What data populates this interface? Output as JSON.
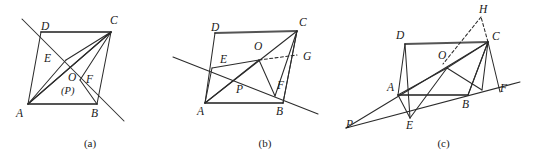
{
  "plate": {
    "width": 537,
    "height": 167,
    "background": "#ffffff",
    "stroke_color": "#2b2b2b",
    "thick_stroke_color": "#555555",
    "label_color": "#1a1a1a"
  },
  "figures": [
    {
      "id": "figure-a",
      "caption": "(a)",
      "description": "Parallelogram ABCD with diagonals and a transversal line through D and B extended; interior points O (also marked P), E on AD side, F near BC side.",
      "labels": [
        {
          "name": "vertex-label-D",
          "text": "D",
          "x": 41,
          "y": 21
        },
        {
          "name": "vertex-label-C",
          "text": "C",
          "x": 110,
          "y": 15
        },
        {
          "name": "vertex-label-E",
          "text": "E",
          "x": 44,
          "y": 53
        },
        {
          "name": "vertex-label-O",
          "text": "O",
          "x": 68,
          "y": 77
        },
        {
          "name": "vertex-label-P",
          "text": "(P)",
          "x": 62,
          "y": 89
        },
        {
          "name": "vertex-label-F",
          "text": "F",
          "x": 86,
          "y": 79
        },
        {
          "name": "vertex-label-A",
          "text": "A",
          "x": 17,
          "y": 108
        },
        {
          "name": "vertex-label-B",
          "text": "B",
          "x": 92,
          "y": 108
        }
      ]
    },
    {
      "id": "figure-b",
      "caption": "(b)",
      "description": "Parallelogram ABCD with a transversal cutting side AD at E and line AB extended beyond B; interior point O joined to A, C and F; G marked on side BC; P marked inside near AB.",
      "labels": [
        {
          "name": "vertex-label-D",
          "text": "D",
          "x": 41,
          "y": 22
        },
        {
          "name": "vertex-label-C",
          "text": "C",
          "x": 129,
          "y": 18
        },
        {
          "name": "vertex-label-O",
          "text": "O",
          "x": 84,
          "y": 42
        },
        {
          "name": "vertex-label-E",
          "text": "E",
          "x": 50,
          "y": 56
        },
        {
          "name": "vertex-label-G",
          "text": "G",
          "x": 134,
          "y": 55
        },
        {
          "name": "vertex-label-P",
          "text": "P",
          "x": 66,
          "y": 86
        },
        {
          "name": "vertex-label-F",
          "text": "F",
          "x": 108,
          "y": 82
        },
        {
          "name": "vertex-label-A",
          "text": "A",
          "x": 28,
          "y": 106
        },
        {
          "name": "vertex-label-B",
          "text": "B",
          "x": 107,
          "y": 106
        }
      ]
    },
    {
      "id": "figure-c",
      "caption": "(c)",
      "description": "Parallelogram ABCD with line through P, E, B and F; interior point O joined to A, C, E and F; dashed segment from C to H above and dashed line H to O region.",
      "labels": [
        {
          "name": "vertex-label-H",
          "text": "H",
          "x": 130,
          "y": 5
        },
        {
          "name": "vertex-label-D",
          "text": "D",
          "x": 47,
          "y": 31
        },
        {
          "name": "vertex-label-C",
          "text": "C",
          "x": 143,
          "y": 32
        },
        {
          "name": "vertex-label-O",
          "text": "O",
          "x": 88,
          "y": 52
        },
        {
          "name": "vertex-label-A",
          "text": "A",
          "x": 38,
          "y": 83
        },
        {
          "name": "vertex-label-B",
          "text": "B",
          "x": 113,
          "y": 101
        },
        {
          "name": "vertex-label-F",
          "text": "F",
          "x": 151,
          "y": 85
        },
        {
          "name": "vertex-label-E",
          "text": "E",
          "x": 56,
          "y": 120
        },
        {
          "name": "vertex-label-P",
          "text": "P",
          "x": 0,
          "y": 120
        }
      ]
    }
  ]
}
